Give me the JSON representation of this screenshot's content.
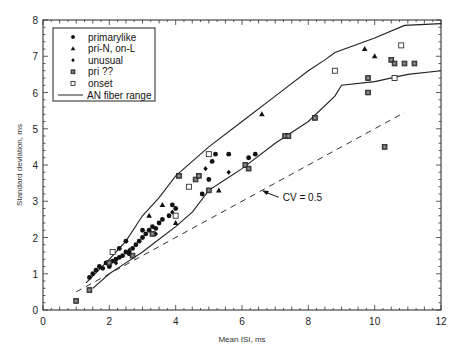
{
  "chart_data": {
    "type": "scatter",
    "title": "",
    "xlabel": "Mean ISI, ms",
    "ylabel": "Standard deviation, ms",
    "xlim": [
      0,
      12
    ],
    "ylim": [
      0,
      8
    ],
    "xticks": [
      "0",
      "2",
      "4",
      "6",
      "8",
      "10",
      "12"
    ],
    "yticks": [
      "0",
      "1",
      "2",
      "3",
      "4",
      "5",
      "6",
      "7",
      "8"
    ],
    "grid": false,
    "legend_position": "upper-left",
    "legend": [
      {
        "label": "primarylike",
        "marker": "filled-circle"
      },
      {
        "label": "pri-N,  on-L",
        "marker": "filled-triangle"
      },
      {
        "label": "unusual",
        "marker": "filled-diamond"
      },
      {
        "label": "pri  ??",
        "marker": "hatched-square"
      },
      {
        "label": "onset",
        "marker": "open-square"
      },
      {
        "label": "AN fiber range",
        "marker": "line"
      }
    ],
    "annotations": [
      {
        "text": "CV = 0.5",
        "x": 7.2,
        "y": 3.0,
        "arrow_to": [
          6.6,
          3.3
        ]
      }
    ],
    "reference_line": {
      "name": "CV = 0.5",
      "style": "dashed",
      "x": [
        1.0,
        10.9
      ],
      "y": [
        0.5,
        5.45
      ]
    },
    "envelope": {
      "name": "AN fiber range",
      "upper": {
        "x": [
          1.3,
          2,
          2.5,
          3,
          3.5,
          4,
          5,
          6,
          7,
          8,
          8.5,
          8.8,
          10,
          10.9,
          12
        ],
        "y": [
          0.75,
          1.4,
          1.9,
          2.6,
          3.1,
          3.7,
          4.5,
          5.2,
          5.9,
          6.6,
          6.9,
          7.1,
          7.5,
          7.85,
          7.9
        ]
      },
      "lower": {
        "x": [
          1.5,
          2,
          2.5,
          3,
          3.5,
          4,
          4.5,
          5,
          5.5,
          6,
          7,
          8,
          8.8,
          9,
          10,
          11,
          12
        ],
        "y": [
          0.6,
          1.0,
          1.3,
          1.6,
          1.95,
          2.3,
          2.7,
          3.3,
          3.6,
          3.9,
          4.6,
          5.2,
          5.9,
          6.2,
          6.3,
          6.5,
          6.6
        ]
      }
    },
    "series": [
      {
        "name": "primarylike",
        "marker": "filled-circle",
        "points": [
          [
            1.4,
            0.9
          ],
          [
            1.5,
            1.0
          ],
          [
            1.6,
            1.1
          ],
          [
            1.7,
            1.2
          ],
          [
            1.8,
            1.15
          ],
          [
            1.9,
            1.3
          ],
          [
            2.0,
            1.2
          ],
          [
            2.1,
            1.35
          ],
          [
            2.2,
            1.4
          ],
          [
            2.3,
            1.45
          ],
          [
            2.4,
            1.5
          ],
          [
            2.5,
            1.6
          ],
          [
            2.6,
            1.55
          ],
          [
            2.7,
            1.7
          ],
          [
            2.8,
            1.8
          ],
          [
            2.9,
            1.9
          ],
          [
            3.0,
            2.0
          ],
          [
            3.1,
            2.1
          ],
          [
            3.2,
            2.2
          ],
          [
            3.3,
            2.3
          ],
          [
            3.4,
            2.25
          ],
          [
            3.5,
            2.4
          ],
          [
            3.6,
            2.5
          ],
          [
            3.8,
            2.6
          ],
          [
            3.9,
            2.9
          ],
          [
            4.0,
            2.8
          ],
          [
            4.8,
            3.2
          ],
          [
            5.0,
            3.6
          ],
          [
            5.1,
            4.1
          ],
          [
            5.2,
            4.3
          ],
          [
            5.6,
            4.3
          ],
          [
            6.2,
            4.2
          ],
          [
            6.4,
            4.3
          ],
          [
            2.3,
            1.7
          ],
          [
            2.5,
            1.9
          ],
          [
            3.0,
            2.2
          ]
        ]
      },
      {
        "name": "pri-N,  on-L",
        "marker": "filled-triangle",
        "points": [
          [
            2.6,
            1.65
          ],
          [
            3.2,
            2.6
          ],
          [
            3.6,
            2.9
          ],
          [
            4.0,
            2.4
          ],
          [
            5.3,
            3.3
          ],
          [
            6.6,
            5.4
          ],
          [
            9.7,
            7.2
          ],
          [
            10.0,
            7.0
          ]
        ]
      },
      {
        "name": "unusual",
        "marker": "filled-diamond",
        "points": [
          [
            2.2,
            1.3
          ],
          [
            3.4,
            2.1
          ],
          [
            3.9,
            2.7
          ],
          [
            4.9,
            3.9
          ],
          [
            5.6,
            3.8
          ]
        ]
      },
      {
        "name": "pri  ??",
        "marker": "hatched-square",
        "points": [
          [
            1.0,
            0.25
          ],
          [
            1.4,
            0.55
          ],
          [
            2.0,
            1.3
          ],
          [
            2.7,
            1.5
          ],
          [
            3.3,
            2.1
          ],
          [
            4.1,
            3.7
          ],
          [
            5.0,
            3.3
          ],
          [
            6.1,
            4.0
          ],
          [
            6.2,
            3.9
          ],
          [
            7.3,
            4.8
          ],
          [
            7.4,
            4.8
          ],
          [
            8.2,
            5.3
          ],
          [
            9.8,
            6.4
          ],
          [
            9.8,
            6.0
          ],
          [
            10.5,
            6.9
          ],
          [
            10.6,
            6.8
          ],
          [
            10.9,
            6.8
          ],
          [
            11.2,
            6.8
          ],
          [
            10.3,
            4.5
          ],
          [
            4.6,
            3.6
          ],
          [
            4.7,
            3.7
          ]
        ]
      },
      {
        "name": "onset",
        "marker": "open-square",
        "points": [
          [
            2.1,
            1.6
          ],
          [
            4.0,
            2.6
          ],
          [
            4.4,
            3.4
          ],
          [
            5.0,
            4.3
          ],
          [
            8.8,
            6.6
          ],
          [
            10.8,
            7.3
          ],
          [
            10.6,
            6.4
          ]
        ]
      }
    ]
  }
}
